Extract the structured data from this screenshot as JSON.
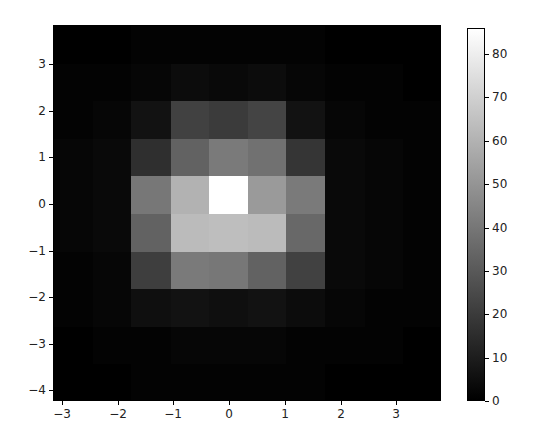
{
  "chart_data": {
    "type": "heatmap",
    "title": "",
    "xlabel": "",
    "ylabel": "",
    "colormap": "gray",
    "xlim": [
      -3.16,
      3.8
    ],
    "ylim": [
      -4.23,
      3.84
    ],
    "x_ticks": [
      -3,
      -2,
      -1,
      0,
      1,
      2,
      3
    ],
    "y_ticks": [
      3,
      2,
      1,
      0,
      -1,
      -2,
      -3,
      -4
    ],
    "grid": false,
    "n_cols": 10,
    "n_rows": 10,
    "x_edges": [
      -3.16,
      -2.46,
      -1.77,
      -1.07,
      -0.38,
      0.32,
      1.01,
      1.71,
      2.41,
      3.1,
      3.8
    ],
    "y_edges_top_to_bottom": [
      3.84,
      3.03,
      2.23,
      1.42,
      0.61,
      -0.2,
      -1.0,
      -1.81,
      -2.62,
      -3.42,
      -4.23
    ],
    "values": [
      [
        0,
        0,
        1,
        1,
        1,
        1,
        1,
        0,
        0,
        0
      ],
      [
        1,
        1,
        2,
        4,
        3,
        4,
        2,
        1,
        1,
        0
      ],
      [
        1,
        2,
        6,
        22,
        20,
        23,
        6,
        2,
        1,
        1
      ],
      [
        2,
        3,
        16,
        33,
        41,
        38,
        18,
        3,
        2,
        1
      ],
      [
        2,
        3,
        40,
        60,
        86,
        52,
        41,
        3,
        2,
        1
      ],
      [
        2,
        3,
        33,
        63,
        64,
        63,
        35,
        3,
        2,
        1
      ],
      [
        1,
        2,
        21,
        41,
        40,
        33,
        22,
        3,
        2,
        1
      ],
      [
        1,
        2,
        5,
        6,
        5,
        6,
        4,
        2,
        1,
        1
      ],
      [
        0,
        1,
        1,
        2,
        2,
        2,
        1,
        1,
        1,
        0
      ],
      [
        0,
        0,
        1,
        1,
        1,
        1,
        1,
        0,
        0,
        0
      ]
    ],
    "colorbar": {
      "min": 0,
      "max": 86,
      "ticks": [
        0,
        10,
        20,
        30,
        40,
        50,
        60,
        70,
        80
      ],
      "position": "right"
    }
  },
  "labels": {
    "x": [
      "−3",
      "−2",
      "−1",
      "0",
      "1",
      "2",
      "3"
    ],
    "y": [
      "3",
      "2",
      "1",
      "0",
      "−1",
      "−2",
      "−3",
      "−4"
    ],
    "cb": [
      "0",
      "10",
      "20",
      "30",
      "40",
      "50",
      "60",
      "70",
      "80"
    ]
  }
}
